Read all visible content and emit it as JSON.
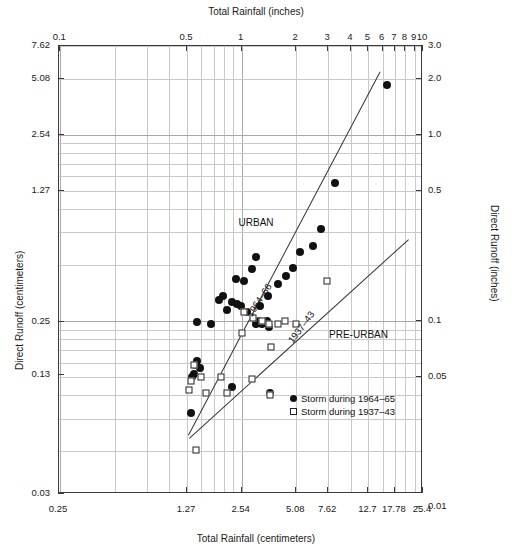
{
  "chart_data": {
    "type": "scatter",
    "title": "",
    "xlabel_top": "Total Rainfall (inches)",
    "xlabel_bottom": "Total Rainfall (centimeters)",
    "ylabel_left": "Direct Runoff (centimeters)",
    "ylabel_right": "Direct Runoff (inches)",
    "xscale": "log",
    "yscale": "log",
    "xlim_cm": [
      0.25,
      25.4
    ],
    "ylim_cm": [
      0.03,
      7.62
    ],
    "grid": true,
    "legend_position": "inside-lower-right",
    "axes": {
      "top_ticks_in": [
        "0.1",
        "0.5",
        "1",
        "2",
        "3",
        "4",
        "5",
        "6",
        "7",
        "8",
        "9",
        "10"
      ],
      "top_tick_values_in": [
        0.1,
        0.5,
        1,
        2,
        3,
        4,
        5,
        6,
        7,
        8,
        9,
        10
      ],
      "bottom_ticks_cm": [
        "0.25",
        "1.27",
        "2.54",
        "5.08",
        "7.62",
        "12.7",
        "17.78",
        "25.4"
      ],
      "bottom_tick_values_cm": [
        0.25,
        1.27,
        2.54,
        5.08,
        7.62,
        12.7,
        17.78,
        25.4
      ],
      "left_ticks_cm": [
        "7.62",
        "5.08",
        "2.54",
        "1.27",
        "0.25",
        "0.13",
        "0.03"
      ],
      "left_tick_values_cm": [
        7.62,
        5.08,
        2.54,
        1.27,
        0.25,
        0.13,
        0.03
      ],
      "right_ticks_in": [
        "3.0",
        "2.0",
        "1.0",
        "0.5",
        "0.1",
        "0.05",
        "0.01"
      ],
      "right_tick_values_in": [
        3.0,
        2.0,
        1.0,
        0.5,
        0.1,
        0.05,
        0.01
      ]
    },
    "annotations": [
      {
        "text": "URBAN",
        "x_cm": 3.05,
        "y_cm": 0.86
      },
      {
        "text": "PRE-URBAN",
        "x_cm": 11.2,
        "y_cm": 0.215
      }
    ],
    "line_labels": [
      {
        "text": "1964–66",
        "x_cm": 3.15,
        "y_cm": 0.33,
        "rotation_deg": -57
      },
      {
        "text": "1937–43",
        "x_cm": 5.4,
        "y_cm": 0.235,
        "rotation_deg": -53
      }
    ],
    "trend_lines": [
      {
        "name": "1964-66 urban",
        "x_cm": [
          1.28,
          14.6
        ],
        "y_cm": [
          0.062,
          5.55
        ]
      },
      {
        "name": "1937-43 pre-urban",
        "x_cm": [
          1.3,
          21.0
        ],
        "y_cm": [
          0.06,
          0.7
        ]
      }
    ],
    "series": [
      {
        "name": "Storm during 1964–65",
        "marker": "filled-circle",
        "color": "#111111",
        "points": [
          [
            16.0,
            4.72
          ],
          [
            8.3,
            1.4
          ],
          [
            6.95,
            0.79
          ],
          [
            6.25,
            0.64
          ],
          [
            5.35,
            0.6
          ],
          [
            4.9,
            0.49
          ],
          [
            4.45,
            0.445
          ],
          [
            4.05,
            0.4
          ],
          [
            3.55,
            0.345
          ],
          [
            3.2,
            0.305
          ],
          [
            3.05,
            0.56
          ],
          [
            2.9,
            0.485
          ],
          [
            2.62,
            0.415
          ],
          [
            3.18,
            0.255
          ],
          [
            3.3,
            0.245
          ],
          [
            3.05,
            0.245
          ],
          [
            3.52,
            0.255
          ],
          [
            3.6,
            0.235
          ],
          [
            2.35,
            0.43
          ],
          [
            2.0,
            0.345
          ],
          [
            2.26,
            0.32
          ],
          [
            2.4,
            0.315
          ],
          [
            2.52,
            0.305
          ],
          [
            2.72,
            0.285
          ],
          [
            1.9,
            0.33
          ],
          [
            2.12,
            0.29
          ],
          [
            1.72,
            0.245
          ],
          [
            1.44,
            0.25
          ],
          [
            1.45,
            0.155
          ],
          [
            1.41,
            0.148
          ],
          [
            1.49,
            0.142
          ],
          [
            1.38,
            0.133
          ],
          [
            1.36,
            0.128
          ],
          [
            2.25,
            0.112
          ],
          [
            3.65,
            0.105
          ],
          [
            1.33,
            0.082
          ]
        ]
      },
      {
        "name": "Storm during 1937–43",
        "marker": "open-square",
        "color": "#222222",
        "points": [
          [
            7.55,
            0.415
          ],
          [
            5.05,
            0.245
          ],
          [
            4.4,
            0.255
          ],
          [
            4.05,
            0.245
          ],
          [
            3.6,
            0.245
          ],
          [
            3.28,
            0.255
          ],
          [
            2.92,
            0.265
          ],
          [
            2.62,
            0.285
          ],
          [
            2.54,
            0.22
          ],
          [
            3.7,
            0.185
          ],
          [
            2.9,
            0.125
          ],
          [
            1.95,
            0.128
          ],
          [
            1.38,
            0.148
          ],
          [
            1.52,
            0.128
          ],
          [
            1.33,
            0.122
          ],
          [
            1.3,
            0.108
          ],
          [
            1.62,
            0.105
          ],
          [
            2.1,
            0.105
          ],
          [
            3.65,
            0.102
          ],
          [
            1.42,
            0.052
          ]
        ]
      }
    ]
  }
}
